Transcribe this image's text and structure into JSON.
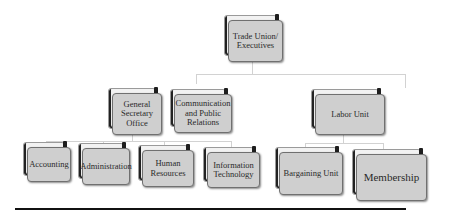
{
  "diagram": {
    "type": "org-chart",
    "root": {
      "label": "Trade Union/\nExecutives",
      "children": [
        {
          "label": "General\nSecretary\nOffice",
          "children": [
            {
              "label": "Accounting"
            },
            {
              "label": "Administration"
            },
            {
              "label": "Human\nResources"
            },
            {
              "label": "Information\nTechnology"
            }
          ]
        },
        {
          "label": "Communication\nand\nPublic Relations"
        },
        {
          "label": "Labor Unit",
          "children": [
            {
              "label": "Bargaining Unit"
            },
            {
              "label": "Membership"
            }
          ]
        }
      ]
    }
  },
  "nodes": {
    "root": "Trade Union/ Executives",
    "general_secretary": "General Secretary Office",
    "communication": "Communication and Public Relations",
    "labor_unit": "Labor Unit",
    "accounting": "Accounting",
    "administration": "Administration",
    "human_resources": "Human Resources",
    "information_technology": "Information Technology",
    "bargaining_unit": "Bargaining Unit",
    "membership": "Membership"
  },
  "colors": {
    "box_fill": "#cfcfcf",
    "box_back": "#f2f2f2",
    "connector": "#d2d2d2",
    "text": "#2a2a2a",
    "rule": "#111111"
  }
}
